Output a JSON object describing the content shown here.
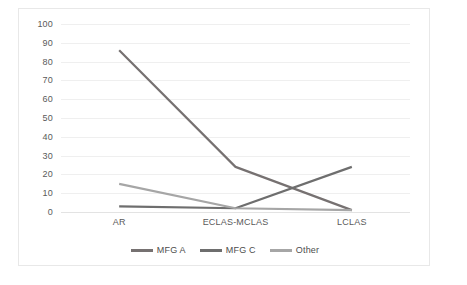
{
  "chart_data": {
    "type": "line",
    "title": "",
    "xlabel": "",
    "ylabel": "",
    "categories": [
      "AR",
      "ECLAS-MCLAS",
      "LCLAS"
    ],
    "series": [
      {
        "name": "MFG A",
        "values": [
          86,
          24,
          1
        ],
        "color": "#767171"
      },
      {
        "name": "MFG C",
        "values": [
          3,
          2,
          24
        ],
        "color": "#6e6e6e"
      },
      {
        "name": "Other",
        "values": [
          15,
          2,
          1
        ],
        "color": "#a6a6a6"
      }
    ],
    "ylim": [
      0,
      100
    ],
    "ytick_step": 10,
    "yticks": [
      "0",
      "10",
      "20",
      "30",
      "40",
      "50",
      "60",
      "70",
      "80",
      "90",
      "100"
    ],
    "grid": true,
    "legend_position": "bottom"
  },
  "axes": {
    "y_tick_labels": [
      "100",
      "90",
      "80",
      "70",
      "60",
      "50",
      "40",
      "30",
      "20",
      "10",
      "0"
    ],
    "x_tick_labels": [
      "AR",
      "ECLAS-MCLAS",
      "LCLAS"
    ]
  },
  "legend": {
    "items": [
      {
        "label": "MFG A",
        "color": "#767171"
      },
      {
        "label": "MFG C",
        "color": "#6e6e6e"
      },
      {
        "label": "Other",
        "color": "#a6a6a6"
      }
    ]
  },
  "colors": {
    "gridline": "#efefef",
    "axis": "#e3e3e3",
    "border": "#e8e8e8",
    "tick_text": "#5a5a5a",
    "legend_text": "#4d4d4d",
    "background": "#ffffff"
  }
}
